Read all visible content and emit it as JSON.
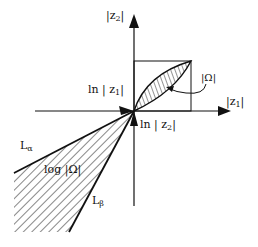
{
  "diagram": {
    "axes": {
      "vertical_label": "|z",
      "vertical_label_sub": "2",
      "vertical_label_end": "|",
      "horizontal_label": "|z",
      "horizontal_label_sub": "1",
      "horizontal_label_end": "|"
    },
    "log_axes": {
      "ln_z1_label": "ln | z",
      "ln_z1_sub": "1",
      "ln_z1_end": "|",
      "ln_z2_label": "ln | z",
      "ln_z2_sub": "2",
      "ln_z2_end": "|"
    },
    "regions": {
      "omega_label": "|Ω|",
      "log_omega_label": "log |Ω|"
    },
    "lines": {
      "l_alpha": "L",
      "l_alpha_sub": "α",
      "l_beta": "L",
      "l_beta_sub": "β"
    },
    "colors": {
      "stroke": "#111111",
      "background": "#ffffff"
    }
  }
}
